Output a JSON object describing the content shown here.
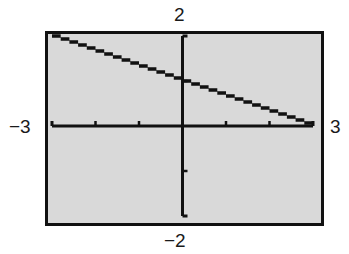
{
  "window": {
    "xmin_label": "−3",
    "xmax_label": "3",
    "ymin_label": "−2",
    "ymax_label": "2"
  },
  "colors": {
    "screen_bg": "#d9d9d9",
    "frame": "#111111",
    "axis": "#111111",
    "plot": "#111111"
  },
  "chart_data": {
    "type": "line",
    "title": "",
    "xlabel": "",
    "ylabel": "",
    "xlim": [
      -3,
      3
    ],
    "ylim": [
      -2,
      2
    ],
    "xscale_ticks": [
      -2,
      -1,
      1,
      2
    ],
    "yscale_ticks": [
      -1,
      1
    ],
    "grid": false,
    "legend": null,
    "series": [
      {
        "name": "y = 1 - x/3",
        "x": [
          -3,
          -2,
          -1,
          0,
          1,
          2,
          3
        ],
        "y": [
          2,
          1.667,
          1.333,
          1,
          0.667,
          0.333,
          0
        ]
      }
    ]
  }
}
